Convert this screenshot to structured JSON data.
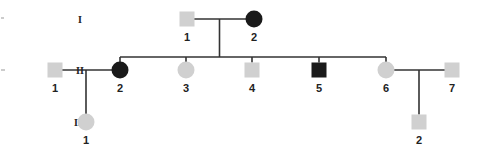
{
  "diagram": {
    "type": "pedigree",
    "colors": {
      "unaffected": "#d0d0d0",
      "affected": "#1a1a1a",
      "line": "#333333"
    },
    "generations": [
      {
        "label": "I",
        "y": 19
      },
      {
        "label": "II",
        "y": 70
      },
      {
        "label": "III",
        "y": 122
      }
    ],
    "individuals": [
      {
        "id": "I-1",
        "gen": "I",
        "num": "1",
        "sex": "male",
        "affected": false,
        "x": 187,
        "y": 19
      },
      {
        "id": "I-2",
        "gen": "I",
        "num": "2",
        "sex": "female",
        "affected": true,
        "x": 254,
        "y": 19
      },
      {
        "id": "II-1",
        "gen": "II",
        "num": "1",
        "sex": "male",
        "affected": false,
        "x": 55,
        "y": 70
      },
      {
        "id": "II-2",
        "gen": "II",
        "num": "2",
        "sex": "female",
        "affected": true,
        "x": 120,
        "y": 70
      },
      {
        "id": "II-3",
        "gen": "II",
        "num": "3",
        "sex": "female",
        "affected": false,
        "x": 186,
        "y": 70
      },
      {
        "id": "II-4",
        "gen": "II",
        "num": "4",
        "sex": "male",
        "affected": false,
        "x": 252,
        "y": 70
      },
      {
        "id": "II-5",
        "gen": "II",
        "num": "5",
        "sex": "male",
        "affected": true,
        "x": 319,
        "y": 70
      },
      {
        "id": "II-6",
        "gen": "II",
        "num": "6",
        "sex": "female",
        "affected": false,
        "x": 386,
        "y": 70
      },
      {
        "id": "II-7",
        "gen": "II",
        "num": "7",
        "sex": "male",
        "affected": false,
        "x": 452,
        "y": 70
      },
      {
        "id": "III-1",
        "gen": "III",
        "num": "1",
        "sex": "female",
        "affected": false,
        "x": 86,
        "y": 122
      },
      {
        "id": "III-2",
        "gen": "III",
        "num": "2",
        "sex": "male",
        "affected": false,
        "x": 419,
        "y": 122
      }
    ],
    "matings": [
      {
        "partners": [
          "I-1",
          "I-2"
        ],
        "children": [
          "II-2",
          "II-3",
          "II-4",
          "II-5",
          "II-6"
        ]
      },
      {
        "partners": [
          "II-1",
          "II-2"
        ],
        "children": [
          "III-1"
        ]
      },
      {
        "partners": [
          "II-6",
          "II-7"
        ],
        "children": [
          "III-2"
        ]
      }
    ]
  }
}
